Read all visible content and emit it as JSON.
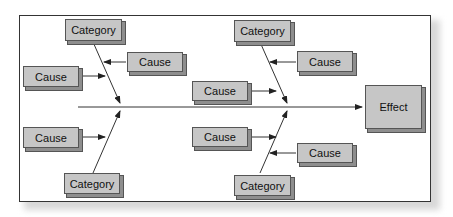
{
  "diagram": {
    "type": "fishbone",
    "effect": {
      "label": "Effect"
    },
    "categories": [
      {
        "label": "Category",
        "position": "top-left"
      },
      {
        "label": "Category",
        "position": "top-right"
      },
      {
        "label": "Category",
        "position": "bottom-left"
      },
      {
        "label": "Category",
        "position": "bottom-right"
      }
    ],
    "causes": [
      {
        "label": "Cause",
        "position": "top-left-inner"
      },
      {
        "label": "Cause",
        "position": "top-left-outer"
      },
      {
        "label": "Cause",
        "position": "top-right-inner"
      },
      {
        "label": "Cause",
        "position": "top-right-outer"
      },
      {
        "label": "Cause",
        "position": "bottom-left-outer"
      },
      {
        "label": "Cause",
        "position": "bottom-right-outer"
      },
      {
        "label": "Cause",
        "position": "bottom-right-inner"
      }
    ]
  },
  "colors": {
    "box_fill": "#c6c6c6",
    "box_border": "#555555",
    "line": "#333333"
  }
}
